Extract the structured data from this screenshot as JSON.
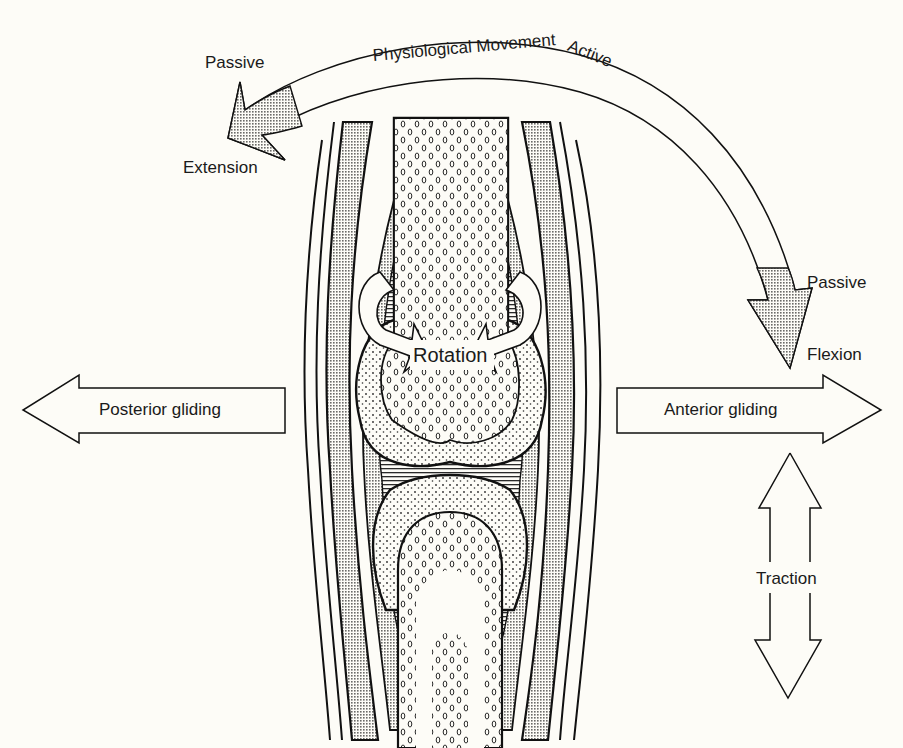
{
  "figure": {
    "colors": {
      "background": "#fdfcf7",
      "ink": "#1a1a1a",
      "stipple_fill": "#b9b9b5",
      "capsule_fill": "#c7c7c3"
    }
  },
  "physiological_arc": {
    "title": "Physiological Movement",
    "top_label": "Active",
    "left_end": {
      "qualifier": "Passive",
      "movement": "Extension"
    },
    "right_end": {
      "qualifier": "Passive",
      "movement": "Flexion"
    }
  },
  "accessory_movements": {
    "rotation": "Rotation",
    "posterior": "Posterior gliding",
    "anterior": "Anterior gliding",
    "traction": "Traction"
  }
}
